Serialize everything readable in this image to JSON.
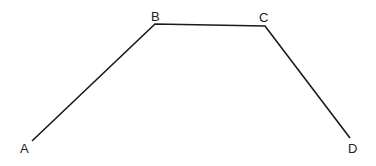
{
  "diagram": {
    "type": "polyline",
    "stroke_color": "#1a1a1a",
    "points": [
      {
        "label": "A",
        "x": 32,
        "y": 141,
        "lx": 20,
        "ly": 153
      },
      {
        "label": "B",
        "x": 155,
        "y": 24,
        "lx": 151,
        "ly": 21
      },
      {
        "label": "C",
        "x": 265,
        "y": 26,
        "lx": 259,
        "ly": 22
      },
      {
        "label": "D",
        "x": 350,
        "y": 138,
        "lx": 348,
        "ly": 153
      }
    ]
  }
}
